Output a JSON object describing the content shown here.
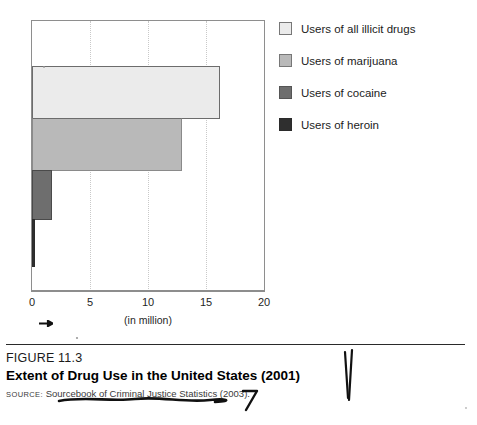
{
  "chart_data": {
    "type": "bar",
    "orientation": "horizontal",
    "title": "Extent of Drug Use in the United States (2001)",
    "xlabel": "(in million)",
    "ylabel": "",
    "xlim": [
      0,
      20
    ],
    "xticks": [
      0,
      5,
      10,
      15,
      20
    ],
    "xtick_labels": [
      "0",
      "5",
      "10",
      "15",
      "20"
    ],
    "grid": "vertical dotted gridlines at 5, 10, 15",
    "legend_position": "right",
    "categories": [
      "Users of all illicit drugs",
      "Users of marijuana",
      "Users of cocaine",
      "Users of heroin"
    ],
    "values": [
      16.2,
      12.9,
      1.7,
      0.1
    ],
    "units": "million",
    "colors": [
      "#ebebeb",
      "#b9b9b9",
      "#6e6e6e",
      "#2f2f2f"
    ]
  },
  "legend": {
    "items": [
      {
        "label": "Users of all illicit drugs",
        "swatch_class": "sw-illicit",
        "color": "#ebebeb"
      },
      {
        "label": "Users of marijuana",
        "swatch_class": "sw-marijuana",
        "color": "#b9b9b9"
      },
      {
        "label": "Users of cocaine",
        "swatch_class": "sw-cocaine",
        "color": "#6e6e6e"
      },
      {
        "label": "Users of heroin",
        "swatch_class": "sw-heroin",
        "color": "#2f2f2f"
      }
    ]
  },
  "axis": {
    "ticks": [
      "0",
      "5",
      "10",
      "15",
      "20"
    ],
    "title": "(in million)"
  },
  "caption": {
    "figure_number": "FIGURE 11.3",
    "title": "Extent of Drug Use in the United States (2001)",
    "source_prefix": "SOURCE:",
    "source_text": "Sourcebook of Criminal Justice Statistics (2003)."
  },
  "annotations": {
    "arrow_mark": "hand-drawn-arrow",
    "underline_mark": "hand-drawn-underline",
    "hook_mark": "hand-drawn-hook",
    "vertical_marks": "hand-drawn-double-vertical-stroke"
  }
}
